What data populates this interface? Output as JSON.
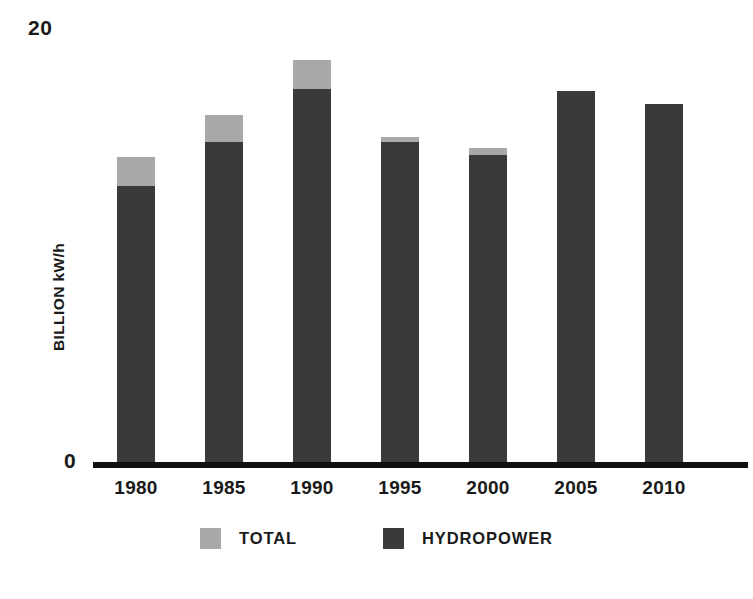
{
  "chart_data": {
    "type": "bar",
    "subtype": "stacked-overlay",
    "title": "",
    "xlabel": "",
    "ylabel": "BILLION kW/h",
    "ylim": [
      0,
      20
    ],
    "grid": false,
    "legend_position": "bottom",
    "categories": [
      "1980",
      "1985",
      "1990",
      "1995",
      "2000",
      "2005",
      "2010"
    ],
    "series": [
      {
        "name": "TOTAL",
        "color": "#a8a8a8",
        "values": [
          13.8,
          15.7,
          18.2,
          14.7,
          14.2,
          16.8,
          16.2
        ]
      },
      {
        "name": "HYDROPOWER",
        "color": "#3a3a3a",
        "values": [
          12.5,
          14.5,
          16.9,
          14.5,
          13.9,
          16.8,
          16.2
        ]
      }
    ],
    "y_ticks": [
      "0",
      "20"
    ],
    "y_tick_values": [
      0,
      20
    ]
  },
  "axis": {
    "y_top_label": "20",
    "y_zero_label": "0",
    "y_title": "BILLION kW/h"
  },
  "legend": {
    "items": [
      {
        "label": "TOTAL",
        "color": "#a8a8a8"
      },
      {
        "label": "HYDROPOWER",
        "color": "#3a3a3a"
      }
    ]
  },
  "colors": {
    "total": "#a8a8a8",
    "hydropower": "#3a3a3a",
    "axis": "#111111",
    "text": "#1a1a1a",
    "background": "#ffffff"
  }
}
